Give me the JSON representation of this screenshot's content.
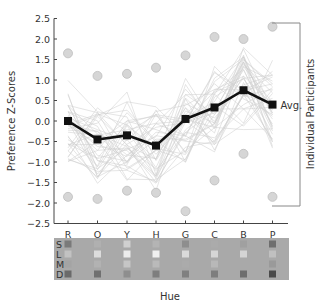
{
  "chart_data": {
    "type": "line",
    "title": "",
    "xlabel": "Hue",
    "ylabel": "Preference Z-Scores",
    "ylim": [
      -2.5,
      2.5
    ],
    "yticks": [
      "2.5",
      "2.0",
      "1.5",
      "1.0",
      "0.5",
      "0.0",
      "-0.5",
      "-1.0",
      "-1.5",
      "-2.0",
      "-2.5"
    ],
    "categories": [
      "R",
      "O",
      "Y",
      "H",
      "G",
      "C",
      "B",
      "P"
    ],
    "series": [
      {
        "name": "Avg.",
        "values": [
          0.0,
          -0.45,
          -0.35,
          -0.6,
          0.05,
          0.33,
          0.75,
          0.4
        ]
      }
    ],
    "individual_max": [
      1.65,
      1.1,
      1.15,
      1.3,
      1.6,
      2.05,
      2.0,
      2.3
    ],
    "individual_min": [
      -1.85,
      -1.9,
      -1.7,
      -1.75,
      -2.2,
      -1.45,
      -0.8,
      -1.85
    ],
    "annotations": {
      "avg_label": "Avg.",
      "bracket_label": "Individual Participants"
    },
    "swatch_rows": [
      "S",
      "L",
      "M",
      "D"
    ],
    "swatch_colors": [
      [
        "#7a7a7a",
        "#b0b0b0",
        "#d0d0d0",
        "#b4b4b4",
        "#8e8e8e",
        "#ababab",
        "#a0a0a0",
        "#6e6e6e"
      ],
      [
        "#c2c2c2",
        "#dcdcdc",
        "#ececec",
        "#f0f0f0",
        "#dadada",
        "#d6d6d6",
        "#d4d4d4",
        "#c0c0c0"
      ],
      [
        "#a4a4a4",
        "#b2b2b2",
        "#c6c6c6",
        "#bababa",
        "#ababab",
        "#b8b8b8",
        "#a9a9a9",
        "#9a9a9a"
      ],
      [
        "#6a6a6a",
        "#707070",
        "#8e8e8e",
        "#7e7e7e",
        "#808080",
        "#7e7e7e",
        "#6e6e6e",
        "#4a4a4a"
      ]
    ],
    "swatch_bg": "#a9a9a9",
    "grid": false,
    "legend_position": "right"
  }
}
